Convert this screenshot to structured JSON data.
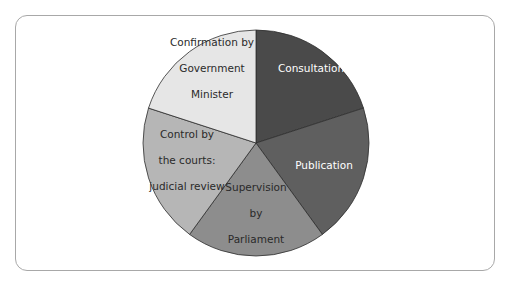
{
  "diagram": {
    "type": "pie",
    "title": "",
    "center": [
      256,
      143
    ],
    "radius": 113,
    "slices": [
      {
        "label": "Consultation",
        "lines": [
          "Consultation"
        ],
        "percent": 20,
        "color": "#4a4a4a",
        "text_color": "#ffffff",
        "label_pos": [
          311,
          68
        ]
      },
      {
        "label": "Publication",
        "lines": [
          "Publication"
        ],
        "percent": 20,
        "color": "#5f5f5f",
        "text_color": "#ffffff",
        "label_pos": [
          324,
          165
        ]
      },
      {
        "label": "Supervision by Parliament",
        "lines": [
          "Supervision",
          "by",
          "Parliament"
        ],
        "percent": 20,
        "color": "#8d8d8d",
        "text_color": "#2a2a2a",
        "label_pos": [
          256,
          213
        ]
      },
      {
        "label": "Control by the courts: judicial review",
        "lines": [
          "Control by",
          "the courts:",
          "judicial review"
        ],
        "percent": 20,
        "color": "#b6b6b6",
        "text_color": "#2a2a2a",
        "label_pos": [
          187,
          160
        ]
      },
      {
        "label": "Confirmation by Government Minister",
        "lines": [
          "Confirmation by",
          "Government",
          "Minister"
        ],
        "percent": 20,
        "color": "#e6e6e6",
        "text_color": "#2a2a2a",
        "label_pos": [
          212,
          68
        ]
      }
    ]
  },
  "chart_data": {
    "type": "pie",
    "title": "",
    "categories": [
      "Consultation",
      "Publication",
      "Supervision by Parliament",
      "Control by the courts: judicial review",
      "Confirmation by Government Minister"
    ],
    "values": [
      20,
      20,
      20,
      20,
      20
    ],
    "colors": [
      "#4a4a4a",
      "#5f5f5f",
      "#8d8d8d",
      "#b6b6b6",
      "#e6e6e6"
    ],
    "start_angle_deg": 0,
    "direction": "clockwise",
    "legend": "none (labels inside slices)"
  }
}
